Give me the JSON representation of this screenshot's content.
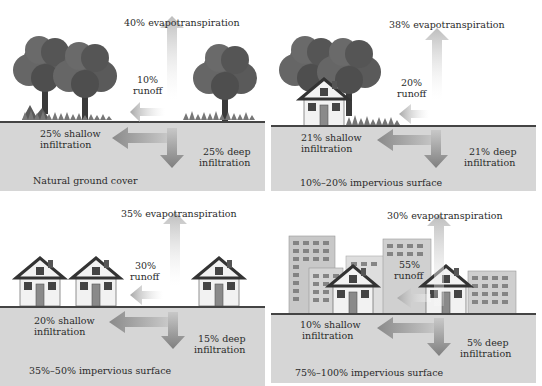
{
  "panels": [
    {
      "id": "natural",
      "evapotranspiration": "40% evapotranspiration",
      "runoff_pct": "10%",
      "runoff_label": "runoff",
      "shallow_pct": "25% shallow",
      "shallow_label": "infiltration",
      "deep_pct": "25% deep",
      "deep_label": "infiltration",
      "caption": "Natural ground cover"
    },
    {
      "id": "low-impervious",
      "evapotranspiration": "38% evapotranspiration",
      "runoff_pct": "20%",
      "runoff_label": "runoff",
      "shallow_pct": "21% shallow",
      "shallow_label": "infiltration",
      "deep_pct": "21% deep",
      "deep_label": "infiltration",
      "caption": "10%–20% impervious surface"
    },
    {
      "id": "medium-impervious",
      "evapotranspiration": "35% evapotranspiration",
      "runoff_pct": "30%",
      "runoff_label": "runoff",
      "shallow_pct": "20% shallow",
      "shallow_label": "infiltration",
      "deep_pct": "15% deep",
      "deep_label": "infiltration",
      "caption": "35%–50% impervious surface"
    },
    {
      "id": "high-impervious",
      "evapotranspiration": "30% evapotranspiration",
      "runoff_pct": "55%",
      "runoff_label": "runoff",
      "shallow_pct": "10% shallow",
      "shallow_label": "infiltration",
      "deep_pct": "5% deep",
      "deep_label": "infiltration",
      "caption": "75%–100% impervious surface"
    }
  ],
  "colors": {
    "ground": "#d6d6d6",
    "ground_line": "#444444",
    "arrow": "#9a9a9a",
    "foliage": "#5a5a5a",
    "house_wall": "#f2f2f2",
    "roof": "#333333"
  }
}
